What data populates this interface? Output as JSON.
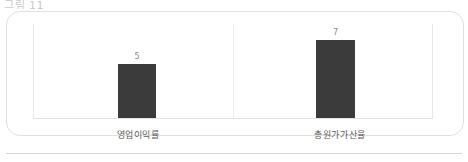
{
  "header": {
    "clipped_text": "그림 11"
  },
  "chart_data": {
    "type": "bar",
    "title": "",
    "xlabel": "",
    "ylabel": "",
    "categories": [
      "영업이익률",
      "총원가가산율"
    ],
    "values": [
      5,
      7
    ],
    "value_labels": [
      "5",
      "7"
    ],
    "ylim": [
      0,
      8.5
    ],
    "grid": false,
    "legend": "none",
    "bar_color": "#3b3b3b",
    "series": [
      {
        "name": "",
        "values": [
          5,
          7
        ]
      }
    ]
  },
  "styles": {
    "bar_color": "#3b3b3b",
    "axis_color": "#e8e8e8",
    "label_color": "#5d5d5d",
    "value_color": "#8a8a8a",
    "card_border": "#e0e0e0",
    "rule_color": "#d8d8d8"
  }
}
